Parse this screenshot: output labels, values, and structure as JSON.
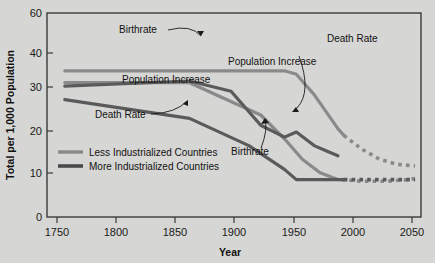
{
  "chart_data": {
    "type": "line",
    "title": "",
    "xlabel": "Year",
    "ylabel": "Total per 1,000 Population",
    "xlim": [
      1750,
      2065
    ],
    "ylim": [
      0,
      60
    ],
    "xticks": [
      1750,
      1800,
      1850,
      1900,
      1950,
      2000,
      2050
    ],
    "xtick_labels": [
      "1750",
      "1800",
      "1850",
      "1900",
      "1950",
      "2000",
      "2050"
    ],
    "yticks": [
      0,
      10,
      20,
      30,
      40,
      60
    ],
    "ytick_labels": [
      "0",
      "10",
      "20",
      "30",
      "40",
      "60"
    ],
    "grid": false,
    "legend_position": "inside-left-lower",
    "series": [
      {
        "name": "Less Industrialized Countries - Birthrate",
        "group": "Less Industrialized Countries",
        "measure": "Birthrate",
        "color": "#8a8a8a",
        "style": "solid",
        "x": [
          1765,
          1870,
          1950,
          1960,
          1975,
          1985,
          1995,
          2000
        ],
        "y": [
          43,
          43,
          43,
          42,
          36,
          31,
          26,
          24
        ]
      },
      {
        "name": "Less Industrialized Countries - Birthrate (projected)",
        "group": "Less Industrialized Countries",
        "measure": "Birthrate",
        "color": "#8a8a8a",
        "style": "dotted",
        "x": [
          2000,
          2015,
          2030,
          2045,
          2060
        ],
        "y": [
          24,
          20,
          17,
          15.5,
          15
        ]
      },
      {
        "name": "Less Industrialized Countries - Death Rate",
        "group": "Less Industrialized Countries",
        "measure": "Death Rate",
        "color": "#8a8a8a",
        "style": "solid",
        "x": [
          1765,
          1870,
          1930,
          1950,
          1965,
          1980,
          1995
        ],
        "y": [
          39.5,
          39.5,
          30,
          23,
          17,
          13,
          11
        ]
      },
      {
        "name": "Less Industrialized Countries - Death Rate (projected)",
        "group": "Less Industrialized Countries",
        "measure": "Death Rate",
        "color": "#8a8a8a",
        "style": "dotted",
        "x": [
          1998,
          2015,
          2035,
          2055,
          2062
        ],
        "y": [
          11,
          10.5,
          10.5,
          11,
          11.5
        ]
      },
      {
        "name": "More Industrialized Countries - Birthrate",
        "group": "More Industrialized Countries",
        "measure": "Birthrate",
        "color": "#5a5a5a",
        "style": "solid",
        "x": [
          1765,
          1870,
          1905,
          1930,
          1950,
          1960,
          1975,
          1985,
          1995
        ],
        "y": [
          38.5,
          40,
          37,
          27,
          23.5,
          25,
          21,
          19.5,
          18
        ]
      },
      {
        "name": "More Industrialized Countries - Death Rate",
        "group": "More Industrialized Countries",
        "measure": "Death Rate",
        "color": "#5a5a5a",
        "style": "solid",
        "x": [
          1765,
          1870,
          1920,
          1950,
          1960,
          2000
        ],
        "y": [
          34.5,
          29,
          21,
          14,
          11,
          11
        ]
      },
      {
        "name": "More Industrialized Countries - Death Rate (projected)",
        "group": "More Industrialized Countries",
        "measure": "Death Rate",
        "color": "#5a5a5a",
        "style": "dotted",
        "x": [
          2000,
          2020,
          2040,
          2060
        ],
        "y": [
          11,
          11,
          11,
          11
        ]
      }
    ],
    "annotations": [
      {
        "id": "birthrate-top",
        "text": "Birthrate",
        "x": 1845,
        "y": 50
      },
      {
        "id": "population-increase-left",
        "text": "Population Increase",
        "x": 1838,
        "y": 33.5
      },
      {
        "id": "death-rate-left",
        "text": "Death Rate",
        "x": 1808,
        "y": 26.5
      },
      {
        "id": "population-increase-right",
        "text": "Population Increase",
        "x": 1932,
        "y": 38
      },
      {
        "id": "death-rate-right",
        "text": "Death Rate",
        "x": 2002,
        "y": 48
      },
      {
        "id": "birthrate-lower",
        "text": "Birthrate",
        "x": 1920,
        "y": 17.5
      }
    ],
    "legend_entries": [
      {
        "label": "Less Industrialized Countries",
        "color": "#8a8a8a"
      },
      {
        "label": "More Industrialized Countries",
        "color": "#5a5a5a"
      }
    ]
  }
}
